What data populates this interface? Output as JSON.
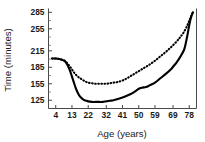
{
  "chart_data": {
    "type": "line",
    "title": "",
    "xlabel": "Age (years)",
    "ylabel": "Time (minutes)",
    "xlim": [
      0,
      82
    ],
    "ylim": [
      110,
      292
    ],
    "grid": false,
    "legend": "none",
    "xticks": [
      4,
      13,
      22,
      32,
      41,
      50,
      59,
      69,
      78
    ],
    "xtick_labels": [
      "4",
      "13",
      "22",
      "32",
      "41",
      "50",
      "59",
      "69",
      "78"
    ],
    "yticks": [
      125,
      155,
      185,
      215,
      255,
      285
    ],
    "ytick_labels": [
      "125",
      "155",
      "185",
      "215",
      "255",
      "285"
    ],
    "series": [
      {
        "name": "solid",
        "style": "solid",
        "color": "#000000",
        "x": [
          2,
          4,
          6,
          8,
          9,
          10,
          11,
          12,
          13,
          14,
          15,
          16,
          17,
          18,
          19,
          20,
          22,
          24,
          26,
          28,
          30,
          32,
          34,
          36,
          38,
          41,
          44,
          46,
          48,
          50,
          52,
          54,
          56,
          59,
          62,
          65,
          68,
          69,
          71,
          73,
          75,
          76,
          77,
          78,
          79,
          80
        ],
        "values": [
          201,
          201,
          200,
          198,
          196,
          192,
          186,
          178,
          168,
          158,
          148,
          140,
          134,
          130,
          127,
          125,
          123,
          122,
          122,
          122,
          122,
          123,
          124,
          125,
          127,
          130,
          134,
          137,
          141,
          146,
          148,
          149,
          152,
          157,
          165,
          173,
          182,
          186,
          194,
          204,
          216,
          228,
          244,
          262,
          276,
          285
        ]
      },
      {
        "name": "dotted",
        "style": "dotted",
        "color": "#000000",
        "x": [
          2,
          4,
          6,
          8,
          9,
          10,
          11,
          12,
          13,
          14,
          15,
          16,
          17,
          18,
          20,
          22,
          24,
          26,
          28,
          30,
          32,
          34,
          36,
          38,
          41,
          44,
          47,
          50,
          53,
          56,
          59,
          62,
          65,
          68,
          71,
          73,
          75,
          77,
          78,
          79,
          80
        ],
        "values": [
          201,
          201,
          200,
          198,
          197,
          194,
          190,
          186,
          181,
          176,
          172,
          169,
          166,
          164,
          160,
          157,
          156,
          155,
          155,
          155,
          155,
          156,
          157,
          158,
          161,
          166,
          172,
          178,
          184,
          190,
          197,
          205,
          213,
          222,
          232,
          240,
          249,
          262,
          270,
          278,
          285
        ]
      }
    ]
  }
}
